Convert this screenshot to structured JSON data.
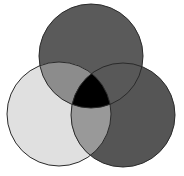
{
  "diagram": {
    "type": "venn",
    "set_count": 3,
    "labels_visible": false,
    "sets": [
      {
        "id": "top",
        "cx": 91,
        "cy": 56,
        "r": 52,
        "fill": "#5a5a5a"
      },
      {
        "id": "left",
        "cx": 59,
        "cy": 114,
        "r": 52,
        "fill": "#e0e0e0"
      },
      {
        "id": "right",
        "cx": 123,
        "cy": 115,
        "r": 52,
        "fill": "#555555"
      }
    ],
    "intersections": {
      "top_left": {
        "fill": "#8c8c8c"
      },
      "top_right": {
        "fill": "#585858"
      },
      "left_right": {
        "fill": "#999999"
      },
      "all_three": {
        "fill": "#000000"
      }
    },
    "stroke": {
      "color": "#2a2a2a",
      "width": 1
    }
  }
}
